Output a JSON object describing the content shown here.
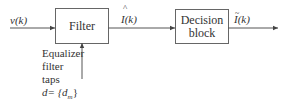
{
  "diagram": {
    "input_signal": "v(k)",
    "blocks": [
      {
        "id": "filter",
        "label": "Filter"
      },
      {
        "id": "decision",
        "label_line1": "Decision",
        "label_line2": "block"
      }
    ],
    "intermediate_signal": "I(k)",
    "intermediate_accent": "^",
    "output_signal": "I(k)",
    "output_accent": "~",
    "taps_label": {
      "line1": "Equalizer",
      "line2": "filter",
      "line3": "taps",
      "line4": "d= {d",
      "line4_sub": "m",
      "line4_end": "}"
    },
    "colors": {
      "stroke": "#555555",
      "text": "#333333"
    }
  }
}
